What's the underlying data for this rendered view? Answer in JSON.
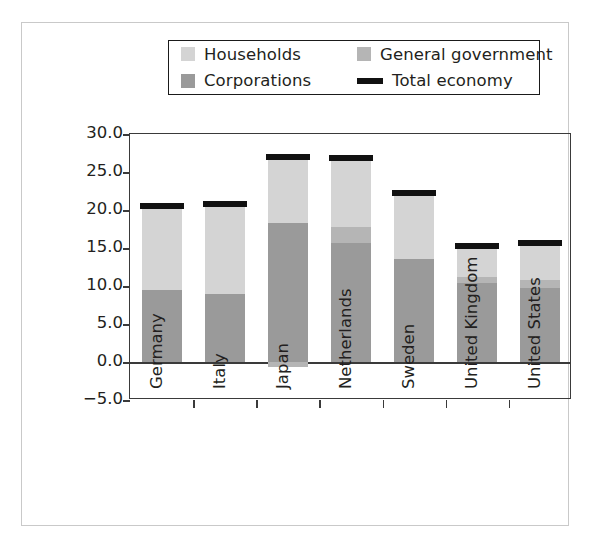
{
  "chart_data": {
    "type": "bar",
    "title": "",
    "subtitle": "",
    "xlabel": "",
    "ylabel": "Sector savings in % of GDP",
    "ylim": [
      -5.0,
      30.0
    ],
    "yticks": [
      "30.0",
      "25.0",
      "20.0",
      "15.0",
      "10.0",
      "5.0",
      "0.0",
      "−5.0"
    ],
    "ytick_values": [
      30.0,
      25.0,
      20.0,
      15.0,
      10.0,
      5.0,
      0.0,
      -5.0
    ],
    "grid": false,
    "stacked": true,
    "legend_position": "top",
    "categories": [
      "Germany",
      "Italy",
      "Japan",
      "Netherlands",
      "Sweden",
      "United Kingdom",
      "United States"
    ],
    "series": [
      {
        "name": "Corporations",
        "color": "#9a9a9a",
        "values": [
          9.5,
          9.0,
          18.3,
          15.6,
          13.5,
          10.4,
          9.8
        ]
      },
      {
        "name": "General government",
        "color": "#b5b5b5",
        "values": [
          0.0,
          0.0,
          0.0,
          2.2,
          0.0,
          0.8,
          1.0
        ]
      },
      {
        "name": "Households",
        "color": "#d4d4d4",
        "values": [
          10.7,
          11.6,
          8.5,
          9.0,
          8.5,
          4.0,
          4.7
        ]
      }
    ],
    "total_economy": {
      "name": "Total economy",
      "color": "#111111",
      "values": [
        20.5,
        20.8,
        27.0,
        26.8,
        22.3,
        15.3,
        15.7
      ]
    },
    "negative_segments": [
      {
        "category": "Japan",
        "series": "General government",
        "value": -0.7
      }
    ]
  },
  "legend": {
    "items": [
      {
        "label": "Households",
        "marker": "swatch",
        "color": "#d4d4d4"
      },
      {
        "label": "General government",
        "marker": "swatch",
        "color": "#b5b5b5"
      },
      {
        "label": "Corporations",
        "marker": "swatch",
        "color": "#9a9a9a"
      },
      {
        "label": "Total economy",
        "marker": "line",
        "color": "#111111"
      }
    ]
  }
}
